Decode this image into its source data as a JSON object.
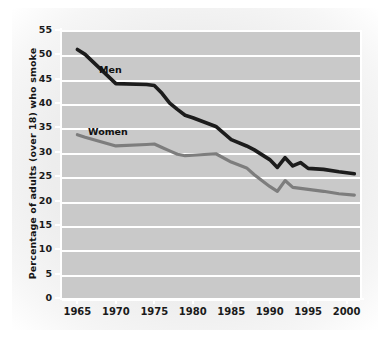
{
  "figure": {
    "y_axis_title": "Percentage of adults (over 18) who smoke",
    "label_men": "Men",
    "label_women": "Women"
  },
  "colors": {
    "plot_background": "#c9c9c9",
    "gridline": "#ffffff",
    "men_line": "#1c1c1c",
    "women_line": "#7d7d7d",
    "tick_text": "#1a1a1a",
    "page_background": "#ededed"
  },
  "chart_data": {
    "type": "line",
    "title": "",
    "subtitle": "",
    "xlabel": "",
    "ylabel": "Percentage of adults (over 18) who smoke",
    "xlim": [
      1963,
      2002
    ],
    "ylim": [
      0,
      55
    ],
    "grid": true,
    "legend_position": "inline-labels",
    "x_tick_labels": [
      "1965",
      "1970",
      "1975",
      "1980",
      "1985",
      "1990",
      "1995",
      "2000"
    ],
    "x_ticks": [
      1965,
      1970,
      1975,
      1980,
      1985,
      1990,
      1995,
      2000
    ],
    "y_tick_labels": [
      "0",
      "5",
      "10",
      "15",
      "20",
      "25",
      "30",
      "35",
      "40",
      "45",
      "50",
      "55"
    ],
    "y_ticks": [
      0,
      5,
      10,
      15,
      20,
      25,
      30,
      35,
      40,
      45,
      50,
      55
    ],
    "annotations": [
      "Men",
      "Women"
    ],
    "series": [
      {
        "name": "Men",
        "x": [
          1965,
          1966,
          1970,
          1974,
          1975,
          1976,
          1977,
          1978,
          1979,
          1980,
          1983,
          1985,
          1987,
          1988,
          1990,
          1991,
          1992,
          1993,
          1994,
          1995,
          1997,
          1999,
          2001
        ],
        "values": [
          51.0,
          50.0,
          44.0,
          43.8,
          43.6,
          42.0,
          40.0,
          38.7,
          37.5,
          37.0,
          35.2,
          32.5,
          31.2,
          30.4,
          28.4,
          26.8,
          28.8,
          27.1,
          27.8,
          26.6,
          26.4,
          25.9,
          25.5
        ]
      },
      {
        "name": "Women",
        "x": [
          1965,
          1966,
          1970,
          1974,
          1975,
          1976,
          1977,
          1978,
          1979,
          1980,
          1983,
          1985,
          1987,
          1988,
          1990,
          1991,
          1992,
          1993,
          1994,
          1995,
          1997,
          1999,
          2001
        ],
        "values": [
          33.5,
          33.0,
          31.2,
          31.5,
          31.6,
          30.9,
          30.2,
          29.5,
          29.2,
          29.3,
          29.6,
          27.9,
          26.7,
          25.3,
          22.9,
          21.9,
          24.1,
          22.7,
          22.5,
          22.3,
          21.9,
          21.4,
          21.1
        ]
      }
    ]
  }
}
